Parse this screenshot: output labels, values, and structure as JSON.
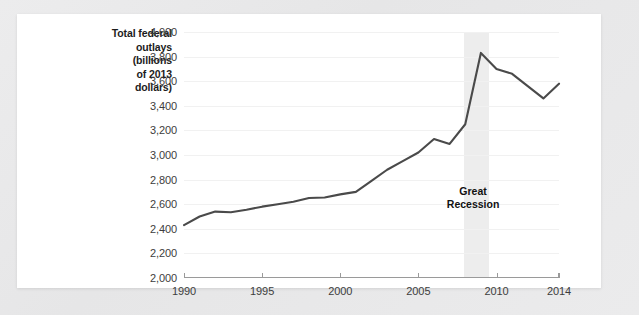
{
  "chart_data": {
    "type": "line",
    "title": "Total federal outlays (billions of 2013 dollars)",
    "title_lines": [
      "Total federal",
      "outlays",
      "(billions",
      "of 2013",
      "dollars)"
    ],
    "xlabel": "",
    "ylabel": "Total federal outlays (billions of 2013 dollars)",
    "xlim": [
      1990,
      2014
    ],
    "ylim": [
      2000,
      4000
    ],
    "grid": true,
    "legend": "none",
    "x_ticks": [
      1990,
      1995,
      2000,
      2005,
      2010,
      2014
    ],
    "x_tick_labels": [
      "1990",
      "1995",
      "2000",
      "2005",
      "2010",
      "2014"
    ],
    "y_ticks": [
      2000,
      2200,
      2400,
      2600,
      2800,
      3000,
      3200,
      3400,
      3600,
      3800,
      4000
    ],
    "y_tick_labels": [
      "2,000",
      "2,200",
      "2,400",
      "2,600",
      "2,800",
      "3,000",
      "3,200",
      "3,400",
      "3,600",
      "3,800",
      "4,000"
    ],
    "x": [
      1990,
      1991,
      1992,
      1993,
      1994,
      1995,
      1996,
      1997,
      1998,
      1999,
      2000,
      2001,
      2002,
      2003,
      2004,
      2005,
      2006,
      2007,
      2008,
      2009,
      2010,
      2011,
      2012,
      2013,
      2014
    ],
    "values": [
      2430,
      2500,
      2540,
      2535,
      2555,
      2580,
      2600,
      2620,
      2650,
      2655,
      2680,
      2700,
      2790,
      2880,
      2950,
      3020,
      3130,
      3090,
      3250,
      3830,
      3700,
      3660,
      3560,
      3460,
      3580
    ],
    "series": [
      {
        "name": "Total federal outlays",
        "color": "#4a4a4a",
        "values": [
          2430,
          2500,
          2540,
          2535,
          2555,
          2580,
          2600,
          2620,
          2650,
          2655,
          2680,
          2700,
          2790,
          2880,
          2950,
          3020,
          3130,
          3090,
          3250,
          3830,
          3700,
          3660,
          3560,
          3460,
          3580
        ]
      }
    ],
    "annotations": [
      {
        "name": "great-recession",
        "lines": [
          "Great",
          "Recession"
        ],
        "text": "Great Recession",
        "x_center": 2008.5,
        "y_center": 2760
      }
    ],
    "shaded_regions": [
      {
        "name": "great-recession-band",
        "x_start": 2007.92,
        "x_end": 2009.5,
        "color": "#ececec"
      }
    ]
  },
  "colors": {
    "line": "#4a4a4a",
    "grid": "#f1f1f1",
    "axis": "#9a9a9a",
    "shade": "#ececec",
    "card": "#ffffff",
    "page": "#e9e9e9",
    "text": "#1c1c1c",
    "tick_text": "#3d3d3d"
  }
}
